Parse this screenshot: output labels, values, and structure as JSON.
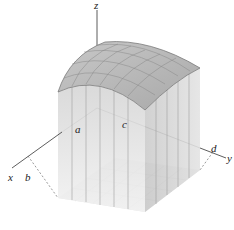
{
  "figure": {
    "axes": {
      "x": "x",
      "y": "y",
      "z": "z"
    },
    "bounds": {
      "a": "a",
      "b": "b",
      "c": "c",
      "d": "d"
    },
    "grid": {
      "rows": 4,
      "cols": 5
    },
    "colors": {
      "surface": "#bdbdbd",
      "surface_edge": "#7a7a7a",
      "column_front": "#e4e4e4",
      "column_side": "#cfcfcf",
      "column_lines": "#9a9a9a",
      "base": "#d9d9d9",
      "axis": "#333333"
    }
  }
}
